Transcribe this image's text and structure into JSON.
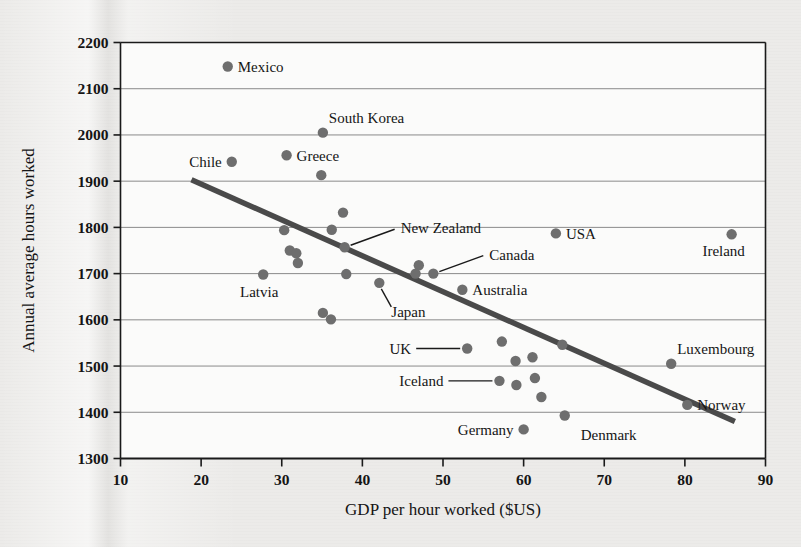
{
  "figure": {
    "background_color": "#ecebe9",
    "plot_background_color": "#fbfbfa",
    "ink_color": "#1a1a1a",
    "point_color": "#6e6e6e",
    "trendline_color": "#4a4a4a",
    "gridline_color": "#8a8a8a"
  },
  "chart_data": {
    "type": "scatter",
    "title": "",
    "xlabel": "GDP per hour worked ($US)",
    "ylabel": "Annual average hours worked",
    "xlim": [
      10,
      90
    ],
    "ylim": [
      1300,
      2200
    ],
    "xticks": [
      10,
      20,
      30,
      40,
      50,
      60,
      70,
      80,
      90
    ],
    "yticks": [
      1300,
      1400,
      1500,
      1600,
      1700,
      1800,
      1900,
      2000,
      2100,
      2200
    ],
    "grid": "horizontal",
    "legend": "none",
    "marker": "filled-circle",
    "points": [
      {
        "label": "Mexico",
        "x": 23.3,
        "y": 2148,
        "label_pos": "right"
      },
      {
        "label": "South Korea",
        "x": 35.1,
        "y": 2005,
        "label_pos": "upper-right"
      },
      {
        "label": "Chile",
        "x": 23.8,
        "y": 1942,
        "label_pos": "left"
      },
      {
        "label": "Greece",
        "x": 30.6,
        "y": 1956,
        "label_pos": "right"
      },
      {
        "label": "",
        "x": 34.9,
        "y": 1913,
        "label_pos": "none"
      },
      {
        "label": "",
        "x": 37.6,
        "y": 1832,
        "label_pos": "none"
      },
      {
        "label": "",
        "x": 30.3,
        "y": 1794,
        "label_pos": "none"
      },
      {
        "label": "",
        "x": 36.2,
        "y": 1795,
        "label_pos": "none"
      },
      {
        "label": "New Zealand",
        "x": 37.8,
        "y": 1757,
        "label_pos": "leader-right"
      },
      {
        "label": "",
        "x": 31.0,
        "y": 1750,
        "label_pos": "none"
      },
      {
        "label": "",
        "x": 31.8,
        "y": 1744,
        "label_pos": "none"
      },
      {
        "label": "",
        "x": 32.0,
        "y": 1723,
        "label_pos": "none"
      },
      {
        "label": "Latvia",
        "x": 27.7,
        "y": 1698,
        "label_pos": "below"
      },
      {
        "label": "",
        "x": 38.0,
        "y": 1699,
        "label_pos": "none"
      },
      {
        "label": "",
        "x": 47.0,
        "y": 1718,
        "label_pos": "none"
      },
      {
        "label": "",
        "x": 46.6,
        "y": 1700,
        "label_pos": "none"
      },
      {
        "label": "Canada",
        "x": 48.8,
        "y": 1700,
        "label_pos": "leader-right"
      },
      {
        "label": "Japan",
        "x": 42.1,
        "y": 1680,
        "label_pos": "leader-below"
      },
      {
        "label": "Australia",
        "x": 52.4,
        "y": 1665,
        "label_pos": "right"
      },
      {
        "label": "",
        "x": 35.1,
        "y": 1615,
        "label_pos": "none"
      },
      {
        "label": "",
        "x": 36.1,
        "y": 1601,
        "label_pos": "none"
      },
      {
        "label": "USA",
        "x": 64.0,
        "y": 1787,
        "label_pos": "right"
      },
      {
        "label": "Ireland",
        "x": 85.8,
        "y": 1785,
        "label_pos": "below-left"
      },
      {
        "label": "",
        "x": 57.3,
        "y": 1553,
        "label_pos": "none"
      },
      {
        "label": "UK",
        "x": 53.0,
        "y": 1538,
        "label_pos": "leader-left"
      },
      {
        "label": "",
        "x": 59.0,
        "y": 1511,
        "label_pos": "none"
      },
      {
        "label": "",
        "x": 61.1,
        "y": 1519,
        "label_pos": "none"
      },
      {
        "label": "",
        "x": 64.8,
        "y": 1546,
        "label_pos": "none"
      },
      {
        "label": "Luxembourg",
        "x": 78.3,
        "y": 1505,
        "label_pos": "upper-right"
      },
      {
        "label": "Iceland",
        "x": 57.0,
        "y": 1468,
        "label_pos": "leader-left"
      },
      {
        "label": "",
        "x": 59.1,
        "y": 1459,
        "label_pos": "none"
      },
      {
        "label": "",
        "x": 61.4,
        "y": 1474,
        "label_pos": "none"
      },
      {
        "label": "",
        "x": 62.2,
        "y": 1433,
        "label_pos": "none"
      },
      {
        "label": "Norway",
        "x": 80.3,
        "y": 1416,
        "label_pos": "right"
      },
      {
        "label": "Denmark",
        "x": 65.1,
        "y": 1393,
        "label_pos": "below-right"
      },
      {
        "label": "Germany",
        "x": 60.0,
        "y": 1363,
        "label_pos": "left"
      }
    ],
    "trendline": {
      "x_start": 18.8,
      "y_start": 1903,
      "x_end": 86.2,
      "y_end": 1380
    }
  }
}
